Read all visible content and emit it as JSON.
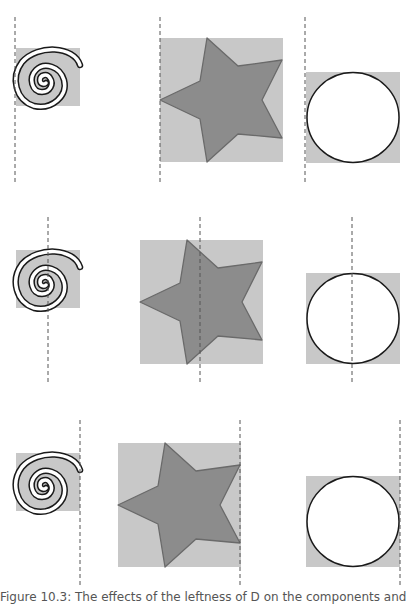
{
  "figure": {
    "caption": "Figure 10.3: The effects of the leftness of D on the components and",
    "rows": [
      {
        "label": "row-left-aligned",
        "dashed_lines_x": [
          15,
          160,
          305
        ],
        "line_y": [
          17,
          183
        ]
      },
      {
        "label": "row-center-aligned",
        "dashed_lines_x": [
          48,
          200,
          352
        ],
        "line_y": [
          217,
          384
        ]
      },
      {
        "label": "row-right-aligned",
        "dashed_lines_x": [
          80,
          240,
          400
        ],
        "line_y": [
          420,
          588
        ]
      }
    ],
    "shapes": [
      "spiral",
      "star",
      "circle"
    ],
    "colors": {
      "box_fill": "#c8c8c8",
      "star_fill": "#8c8c8c",
      "star_stroke": "#6a6a6a",
      "circle_fill": "#ffffff",
      "outline": "#1a1a1a",
      "dash": "#555555"
    }
  }
}
